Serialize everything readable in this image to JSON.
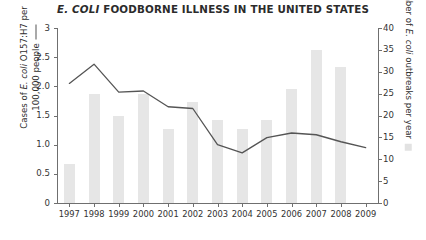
{
  "title": {
    "emphasis": "E. COLI",
    "rest": " FOODBORNE ILLNESS IN THE UNITED STATES",
    "full": "E. COLI FOODBORNE ILLNESS IN THE UNITED STATES"
  },
  "axes": {
    "left": {
      "line1": "Cases of ",
      "line1_italic": "E. coli",
      "line1_tail": " O157:H7 per",
      "line2": "100,000 people",
      "ticks": [
        "3",
        "2.5",
        "2.0",
        "1.5",
        "1.0",
        "0.5",
        "0"
      ],
      "legend_marker": "line-marker"
    },
    "right": {
      "pre": "Number of ",
      "italic": "E. coli",
      "post": " outbreaks per year",
      "ticks": [
        "40",
        "35",
        "30",
        "25",
        "20",
        "15",
        "10",
        "5",
        "0"
      ],
      "legend_marker": "square-marker"
    },
    "x": {
      "ticks": [
        "1997",
        "1998",
        "1999",
        "2000",
        "2001",
        "2002",
        "2003",
        "2004",
        "2005",
        "2006",
        "2007",
        "2008",
        "2009"
      ]
    }
  },
  "colors": {
    "bar": "#e6e6e6",
    "line": "#555555",
    "axis": "#6f6f6f",
    "text": "#333333"
  },
  "chart_data": {
    "type": "bar",
    "title": "E. COLI FOODBORNE ILLNESS IN THE UNITED STATES",
    "xlabel": "",
    "categories": [
      "1997",
      "1998",
      "1999",
      "2000",
      "2001",
      "2002",
      "2003",
      "2004",
      "2005",
      "2006",
      "2007",
      "2008",
      "2009"
    ],
    "grid": false,
    "legend_position": "axis-labels",
    "series": [
      {
        "name": "Number of E. coli outbreaks per year",
        "type": "bar",
        "axis": "right",
        "ylabel": "Number of E. coli outbreaks per year",
        "ylim": [
          0,
          40
        ],
        "ytick_step": 5,
        "color": "#e6e6e6",
        "values": [
          9,
          25,
          20,
          25,
          17,
          23,
          19,
          17,
          19,
          26,
          35,
          31,
          null
        ]
      },
      {
        "name": "Cases of E. coli O157:H7 per 100,000 people",
        "type": "line",
        "axis": "left",
        "ylabel": "Cases of E. coli O157:H7 per 100,000 people",
        "ylim": [
          0,
          3
        ],
        "ytick_step": 0.5,
        "color": "#555555",
        "values": [
          2.05,
          2.38,
          1.9,
          1.92,
          1.65,
          1.62,
          1.0,
          0.86,
          1.12,
          1.2,
          1.17,
          1.05,
          0.95
        ]
      }
    ]
  }
}
